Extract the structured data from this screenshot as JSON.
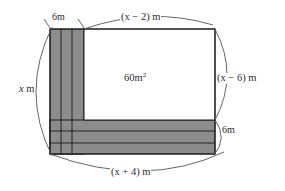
{
  "figure": {
    "type": "geometry-diagram",
    "colors": {
      "shaded_fill": "#8c8c8c",
      "inner_fill": "#ffffff",
      "stroke": "#1a1a1a",
      "arc_stroke": "#555555",
      "text": "#2b2b2b",
      "background": "#ffffff"
    },
    "labels": {
      "top_width": "(x − 2) m",
      "right_height": "(x − 6) m",
      "left_height": "x m",
      "left_height_var": "x",
      "left_height_unit": " m",
      "bottom_width": "(x + 4) m",
      "inner_area_value": "60m",
      "inner_area_exponent": "2",
      "path_width_top": "6m",
      "path_width_bottom": "6m"
    },
    "dimension_arcs": [
      {
        "name": "top-arc",
        "label": "(x − 2) m",
        "orientation": "horizontal",
        "span": "inner rectangle width"
      },
      {
        "name": "right-arc",
        "label": "(x − 6) m",
        "orientation": "vertical",
        "span": "inner rectangle height"
      },
      {
        "name": "left-arc",
        "label": "x m",
        "orientation": "vertical",
        "span": "total figure height"
      },
      {
        "name": "bottom-arc",
        "label": "(x + 4) m",
        "orientation": "horizontal",
        "span": "total figure width"
      },
      {
        "name": "top-brace",
        "label": "6m",
        "orientation": "horizontal",
        "span": "vertical shaded strip width"
      },
      {
        "name": "right-brace",
        "label": "6m",
        "orientation": "vertical",
        "span": "horizontal shaded band height"
      }
    ],
    "regions": [
      {
        "name": "vertical-shaded-strip",
        "fill": "shaded",
        "subdivisions": 3
      },
      {
        "name": "horizontal-shaded-band",
        "fill": "shaded",
        "subdivisions": 3
      },
      {
        "name": "inner-white-rectangle",
        "fill": "white",
        "area_label": "60m²"
      }
    ]
  }
}
